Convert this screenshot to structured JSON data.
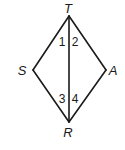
{
  "diagram": {
    "type": "geometry-quadrilateral",
    "vertices": [
      {
        "name": "T",
        "x": 69,
        "y": 16,
        "label_x": 68,
        "label_y": 13
      },
      {
        "name": "S",
        "x": 33,
        "y": 70,
        "label_x": 22,
        "label_y": 75
      },
      {
        "name": "A",
        "x": 106,
        "y": 70,
        "label_x": 113,
        "label_y": 75
      },
      {
        "name": "R",
        "x": 69,
        "y": 122,
        "label_x": 68,
        "label_y": 137
      }
    ],
    "edges": [
      {
        "from": "T",
        "to": "S"
      },
      {
        "from": "S",
        "to": "R"
      },
      {
        "from": "R",
        "to": "A"
      },
      {
        "from": "A",
        "to": "T"
      },
      {
        "from": "T",
        "to": "R"
      }
    ],
    "angles": [
      {
        "label": "1",
        "x": 62,
        "y": 46
      },
      {
        "label": "2",
        "x": 75,
        "y": 46
      },
      {
        "label": "3",
        "x": 62,
        "y": 103
      },
      {
        "label": "4",
        "x": 75,
        "y": 103
      }
    ],
    "stroke_color": "#1a1a1a",
    "background": "#ffffff"
  }
}
